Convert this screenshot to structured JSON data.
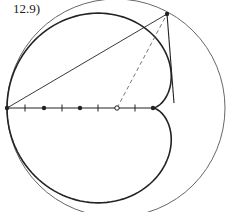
{
  "figure": {
    "label": "12.9)",
    "colors": {
      "stroke": "#222222",
      "thin": "#555555",
      "dashed": "#666666",
      "background": "#ffffff"
    },
    "large_circle": {
      "cx": 116,
      "cy": 108,
      "r": 109
    },
    "cardioid": {
      "cusp_x": 153,
      "cusp_y": 108,
      "a": 73
    },
    "axis": {
      "y": 108,
      "x1": 7,
      "x2": 153
    },
    "ticks_x": [
      25,
      62,
      98,
      135
    ],
    "solid_points": [
      [
        7,
        108
      ],
      [
        44,
        108
      ],
      [
        80,
        108
      ],
      [
        153,
        108
      ],
      [
        167,
        14
      ]
    ],
    "hollow_point": [
      117,
      108
    ],
    "chord": {
      "x1": 7,
      "y1": 108,
      "x2": 167,
      "y2": 14
    },
    "tangent": {
      "x1": 167,
      "y1": 14,
      "x2": 174,
      "y2": 103
    },
    "dashed": {
      "x1": 117,
      "y1": 108,
      "x2": 167,
      "y2": 14
    }
  }
}
